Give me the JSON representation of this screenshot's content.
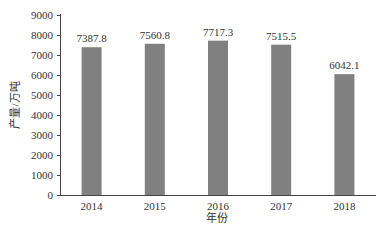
{
  "chart_data": {
    "type": "bar",
    "title": "",
    "xlabel": "年份",
    "ylabel": "产量/万吨",
    "categories": [
      "2014",
      "2015",
      "2016",
      "2017",
      "2018"
    ],
    "values": [
      7387.8,
      7560.8,
      7717.3,
      7515.5,
      6042.1
    ],
    "value_labels": [
      "7387.8",
      "7560.8",
      "7717.3",
      "7515.5",
      "6042.1"
    ],
    "ylim": [
      0,
      9000
    ],
    "yticks": [
      0,
      1000,
      2000,
      3000,
      4000,
      5000,
      6000,
      7000,
      8000,
      9000
    ],
    "grid": false,
    "legend": null,
    "bar_color": "#808080"
  }
}
